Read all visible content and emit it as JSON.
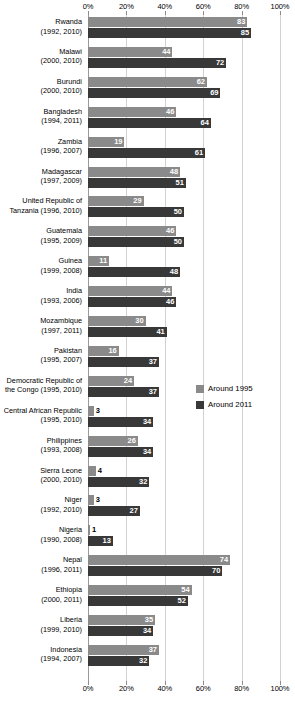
{
  "chart_data": {
    "type": "bar",
    "orientation": "horizontal",
    "title": "",
    "xlabel": "",
    "ylabel": "",
    "xlim": [
      0,
      100
    ],
    "grid": true,
    "legend_position": "middle-right",
    "axis_ticks": [
      "0%",
      "20%",
      "40%",
      "60%",
      "80%",
      "100%"
    ],
    "axis_tick_values": [
      0,
      20,
      40,
      60,
      80,
      100
    ],
    "legend": [
      {
        "name": "Around 1995",
        "color": "#8a8a8a"
      },
      {
        "name": "Around 2011",
        "color": "#383838"
      }
    ],
    "series": [
      {
        "name": "Around 1995",
        "color": "#8a8a8a",
        "values": [
          83,
          44,
          62,
          46,
          19,
          48,
          29,
          46,
          11,
          44,
          30,
          16,
          24,
          3,
          26,
          4,
          3,
          1,
          74,
          54,
          35,
          37
        ]
      },
      {
        "name": "Around 2011",
        "color": "#383838",
        "values": [
          85,
          72,
          69,
          64,
          61,
          51,
          50,
          50,
          48,
          46,
          41,
          37,
          37,
          34,
          34,
          32,
          27,
          13,
          70,
          52,
          34,
          32
        ]
      }
    ],
    "categories": [
      {
        "country": "Rwanda",
        "years": "(1992, 2010)"
      },
      {
        "country": "Malawi",
        "years": "(2000, 2010)"
      },
      {
        "country": "Burundi",
        "years": "(2000, 2010)"
      },
      {
        "country": "Bangladesh",
        "years": "(1994, 2011)"
      },
      {
        "country": "Zambia",
        "years": "(1996, 2007)"
      },
      {
        "country": "Madagascar",
        "years": "(1997, 2009)"
      },
      {
        "country": "United Republic of",
        "years": "Tanzania (1996, 2010)"
      },
      {
        "country": "Guatemala",
        "years": "(1995, 2009)"
      },
      {
        "country": "Guinea",
        "years": "(1999, 2008)"
      },
      {
        "country": "India",
        "years": "(1993, 2006)"
      },
      {
        "country": "Mozambique",
        "years": "(1997, 2011)"
      },
      {
        "country": "Pakistan",
        "years": "(1995, 2007)"
      },
      {
        "country": "Democratic Republic of",
        "years": "the Congo (1995, 2010)"
      },
      {
        "country": "Central African Republic",
        "years": "(1995, 2010)"
      },
      {
        "country": "Philippines",
        "years": "(1993, 2008)"
      },
      {
        "country": "Sierra Leone",
        "years": "(2000, 2010)"
      },
      {
        "country": "Niger",
        "years": "(1992, 2010)"
      },
      {
        "country": "Nigeria",
        "years": "(1990, 2008)"
      },
      {
        "country": "Nepal",
        "years": "(1996, 2011)"
      },
      {
        "country": "Ethiopia",
        "years": "(2000, 2011)"
      },
      {
        "country": "Liberia",
        "years": "(1999, 2010)"
      },
      {
        "country": "Indonesia",
        "years": "(1994, 2007)"
      }
    ]
  }
}
